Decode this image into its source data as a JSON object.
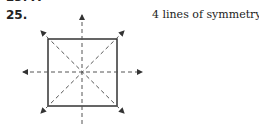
{
  "problem": {
    "previous_fragment": "23. A",
    "number": "25.",
    "answer": "4 lines of symmetry"
  },
  "figure": {
    "shape": "square",
    "lines_of_symmetry": 4,
    "line_style": "dashed with arrowheads",
    "colors": {
      "stroke": "#333333",
      "dashed": "#555555"
    }
  }
}
